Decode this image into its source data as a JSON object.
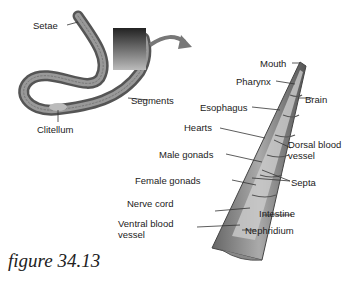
{
  "figure": {
    "caption": "figure 34.13",
    "left_panel": {
      "labels": {
        "setae": "Setae",
        "segments": "Segments",
        "clitellum": "Clitellum"
      }
    },
    "right_panel": {
      "labels": {
        "mouth": "Mouth",
        "pharynx": "Pharynx",
        "brain": "Brain",
        "esophagus": "Esophagus",
        "hearts": "Hearts",
        "dorsal_blood_vessel_1": "Dorsal blood",
        "dorsal_blood_vessel_2": "vessel",
        "male_gonads": "Male gonads",
        "septa": "Septa",
        "female_gonads": "Female gonads",
        "nerve_cord": "Nerve cord",
        "intestine": "Intestine",
        "ventral_blood_vessel_1": "Ventral blood",
        "ventral_blood_vessel_2": "vessel",
        "nephridium": "Nephridium"
      }
    }
  }
}
